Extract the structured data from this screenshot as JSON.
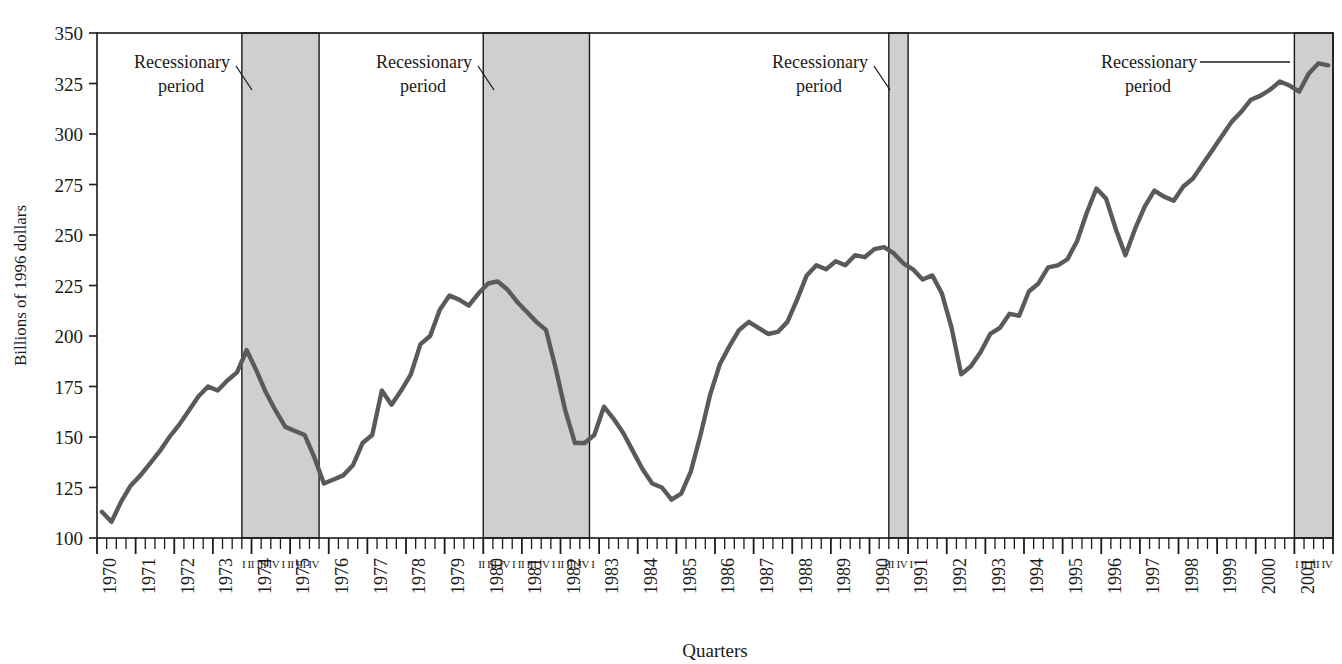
{
  "chart_data": {
    "type": "line",
    "title": "",
    "xlabel": "Quarters",
    "ylabel": "Billions of 1996 dollars",
    "ylim": [
      100,
      350
    ],
    "yticks": [
      100,
      125,
      150,
      175,
      200,
      225,
      250,
      275,
      300,
      325,
      350
    ],
    "ytick_labels": [
      "100",
      "125",
      "150",
      "175",
      "200",
      "225",
      "250",
      "275",
      "300",
      "325",
      "350"
    ],
    "grid": false,
    "legend_position": "none",
    "x_start_year": 1970,
    "x_end_year": 2001,
    "x_tick_labels": [
      "1970",
      "1971",
      "1972",
      "1973",
      "1974",
      "1975",
      "1976",
      "1977",
      "1978",
      "1979",
      "1980",
      "1981",
      "1982",
      "1983",
      "1984",
      "1985",
      "1986",
      "1987",
      "1988",
      "1989",
      "1990",
      "1991",
      "1992",
      "1993",
      "1994",
      "1995",
      "1996",
      "1997",
      "1998",
      "1999",
      "2000",
      "2001"
    ],
    "series": [
      {
        "name": "Real business fixed investment",
        "color": "#5a5a5a",
        "values": [
          113,
          108,
          118,
          126,
          131,
          137,
          143,
          150,
          156,
          163,
          170,
          175,
          173,
          178,
          182,
          193,
          183,
          172,
          163,
          155,
          153,
          151,
          140,
          127,
          129,
          131,
          136,
          147,
          151,
          173,
          166,
          173,
          181,
          196,
          200,
          213,
          220,
          218,
          215,
          221,
          226,
          227,
          223,
          217,
          212,
          207,
          203,
          184,
          163,
          147,
          147,
          151,
          165,
          159,
          152,
          143,
          134,
          127,
          125,
          119,
          122,
          133,
          151,
          171,
          186,
          195,
          203,
          207,
          204,
          201,
          202,
          207,
          218,
          230,
          235,
          233,
          237,
          235,
          240,
          239,
          243,
          244,
          241,
          236,
          233,
          228,
          230,
          221,
          204,
          181,
          185,
          192,
          201,
          204,
          211,
          210,
          222,
          226,
          234,
          235,
          238,
          247,
          261,
          273,
          268,
          253,
          240,
          253,
          264,
          272,
          269,
          267,
          274,
          278,
          285,
          292,
          299,
          306,
          311,
          317,
          319,
          322,
          326,
          324,
          321,
          330,
          335,
          334
        ]
      }
    ],
    "recessions": [
      {
        "label_line1": "Recessionary",
        "label_line2": "period",
        "start_year": 1973.75,
        "end_year": 1975.75,
        "quarters": "I II III IV I II III IV"
      },
      {
        "label_line1": "Recessionary",
        "label_line2": "period",
        "start_year": 1980.0,
        "end_year": 1982.75,
        "quarters": "II III IV I II III IV I II III IV I"
      },
      {
        "label_line1": "Recessionary",
        "label_line2": "period",
        "start_year": 1990.5,
        "end_year": 1991.0,
        "quarters": "III IV I"
      },
      {
        "label_line1": "Recessionary",
        "label_line2": "period",
        "start_year": 2001.0,
        "end_year": 2002.0,
        "quarters": "I II III IV"
      }
    ],
    "colors": {
      "line": "#5a5a5a",
      "recession_band": "#cfcfcf",
      "axis": "#1a1a1a",
      "text": "#1a1a1a",
      "background": "#ffffff"
    }
  }
}
